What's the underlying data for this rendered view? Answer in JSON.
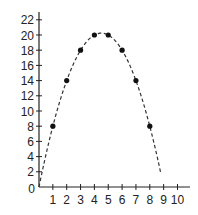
{
  "chart_data": {
    "type": "scatter",
    "title": "",
    "xlabel": "",
    "ylabel": "",
    "xlim": [
      0,
      10
    ],
    "ylim": [
      0,
      22
    ],
    "x_ticks": [
      1,
      2,
      3,
      4,
      5,
      6,
      7,
      8,
      9,
      10
    ],
    "y_ticks": [
      2,
      4,
      6,
      8,
      10,
      12,
      14,
      16,
      18,
      20,
      22
    ],
    "origin_label": "0",
    "grid": false,
    "legend": null,
    "series": [
      {
        "name": "points",
        "kind": "scatter",
        "x": [
          1,
          2,
          3,
          4,
          5,
          6,
          7,
          8
        ],
        "y": [
          8,
          14,
          18,
          20,
          20,
          18,
          14,
          8
        ]
      },
      {
        "name": "curve",
        "kind": "dashed-line",
        "equation": "y = 9x - x^2",
        "x_range": [
          0,
          8.8
        ]
      }
    ],
    "colors": {
      "axis": "#222222",
      "points": "#111111",
      "curve": "#333333"
    }
  }
}
